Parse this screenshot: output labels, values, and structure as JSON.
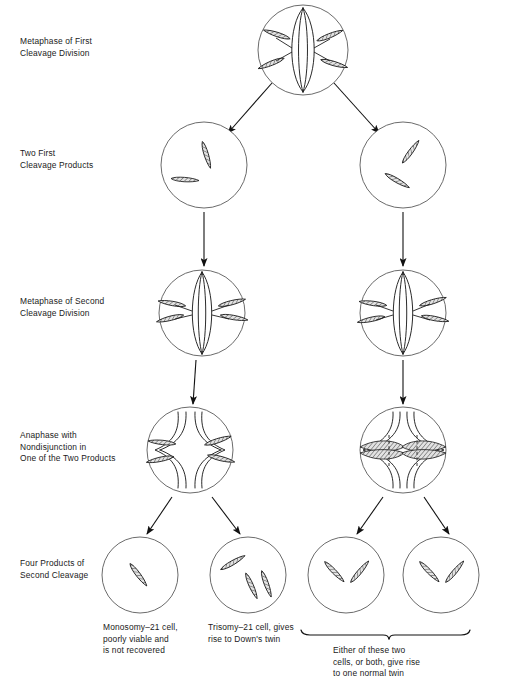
{
  "figure": {
    "stage_labels": [
      {
        "id": "metaphase-first-cleavage",
        "text": "Metaphase of First\nCleavage Division"
      },
      {
        "id": "two-first-cleavage-products",
        "text": "Two First\nCleavage Products"
      },
      {
        "id": "metaphase-second-cleavage",
        "text": "Metaphase of Second\nCleavage Division"
      },
      {
        "id": "anaphase-nondisjunction",
        "text": "Anaphase with\nNondisjunction in\nOne of the Two Products"
      },
      {
        "id": "four-products-second-cleavage",
        "text": "Four Products of\nSecond Cleavage"
      }
    ],
    "captions": [
      {
        "id": "monosomy-caption",
        "text": "Monosomy–21 cell,\npoorly viable and\nis not recovered"
      },
      {
        "id": "trisomy-caption",
        "text": "Trisomy–21 cell, gives\nrise to Down's twin"
      },
      {
        "id": "normal-twin-caption",
        "text": "Either of these two\ncells, or both, give rise\nto one normal twin"
      }
    ],
    "cells": [
      {
        "id": "cell-metaphase-1",
        "row": "metaphase-first",
        "cx": 303,
        "cy": 50,
        "r": 45,
        "chromosome_count": 4,
        "spindle": "metaphase",
        "note": "four chromosomes at metaphase plate"
      },
      {
        "id": "cell-first-product-left",
        "row": "first-products",
        "cx": 204,
        "cy": 165,
        "r": 43,
        "chromosome_count": 2,
        "spindle": "none",
        "note": "two chromosomes"
      },
      {
        "id": "cell-first-product-right",
        "row": "first-products",
        "cx": 403,
        "cy": 165,
        "r": 43,
        "chromosome_count": 2,
        "spindle": "none",
        "note": "two chromosomes"
      },
      {
        "id": "cell-metaphase-2-left",
        "row": "metaphase-second",
        "cx": 202,
        "cy": 313,
        "r": 43,
        "chromosome_count": 4,
        "spindle": "metaphase",
        "note": "two chromosomes each side of plate"
      },
      {
        "id": "cell-metaphase-2-right",
        "row": "metaphase-second",
        "cx": 403,
        "cy": 313,
        "r": 43,
        "chromosome_count": 4,
        "spindle": "metaphase",
        "note": "two chromosomes each side of plate"
      },
      {
        "id": "cell-anaphase-left",
        "row": "anaphase",
        "cx": 190,
        "cy": 450,
        "r": 43,
        "chromosome_count": 4,
        "spindle": "anaphase",
        "note": "nondisjunction: one chromosome to left pole, three to right"
      },
      {
        "id": "cell-anaphase-right",
        "row": "anaphase",
        "cx": 403,
        "cy": 450,
        "r": 43,
        "chromosome_count": 4,
        "spindle": "anaphase",
        "note": "normal disjunction, dashed separation lines"
      },
      {
        "id": "cell-monosomy-21",
        "row": "four-products",
        "cx": 140,
        "cy": 575,
        "r": 38,
        "chromosome_count": 1,
        "spindle": "none",
        "note": "monosomy-21"
      },
      {
        "id": "cell-trisomy-21",
        "row": "four-products",
        "cx": 248,
        "cy": 575,
        "r": 38,
        "chromosome_count": 3,
        "spindle": "none",
        "note": "trisomy-21"
      },
      {
        "id": "cell-normal-left",
        "row": "four-products",
        "cx": 346,
        "cy": 575,
        "r": 38,
        "chromosome_count": 2,
        "spindle": "none",
        "note": "normal"
      },
      {
        "id": "cell-normal-right",
        "row": "four-products",
        "cx": 441,
        "cy": 575,
        "r": 38,
        "chromosome_count": 2,
        "spindle": "none",
        "note": "normal"
      }
    ],
    "arrows": [
      {
        "id": "arrow-metaphase1-to-left-product",
        "x1": 272,
        "y1": 83,
        "x2": 228,
        "y2": 133
      },
      {
        "id": "arrow-metaphase1-to-right-product",
        "x1": 334,
        "y1": 83,
        "x2": 379,
        "y2": 133
      },
      {
        "id": "arrow-left-product-to-metaphase2",
        "x1": 204,
        "y1": 212,
        "x2": 204,
        "y2": 266
      },
      {
        "id": "arrow-right-product-to-metaphase2",
        "x1": 403,
        "y1": 212,
        "x2": 403,
        "y2": 266
      },
      {
        "id": "arrow-left-metaphase2-to-anaphase",
        "x1": 196,
        "y1": 360,
        "x2": 193,
        "y2": 404
      },
      {
        "id": "arrow-right-metaphase2-to-anaphase",
        "x1": 403,
        "y1": 360,
        "x2": 403,
        "y2": 404
      },
      {
        "id": "arrow-anaphase-left-to-monosomy",
        "x1": 172,
        "y1": 497,
        "x2": 147,
        "y2": 534
      },
      {
        "id": "arrow-anaphase-left-to-trisomy",
        "x1": 212,
        "y1": 497,
        "x2": 240,
        "y2": 534
      },
      {
        "id": "arrow-anaphase-right-to-normal-1",
        "x1": 383,
        "y1": 497,
        "x2": 357,
        "y2": 534
      },
      {
        "id": "arrow-anaphase-right-to-normal-2",
        "x1": 424,
        "y1": 497,
        "x2": 449,
        "y2": 534
      }
    ],
    "bracket": {
      "id": "normal-twin-bracket",
      "x1": 301,
      "x2": 470,
      "y": 633,
      "tip_x": 388
    },
    "colors": {
      "ink": "#1a1a1a",
      "outline": "#555555",
      "chromosome_fill": "#d8d8d8",
      "background": "#ffffff"
    }
  }
}
